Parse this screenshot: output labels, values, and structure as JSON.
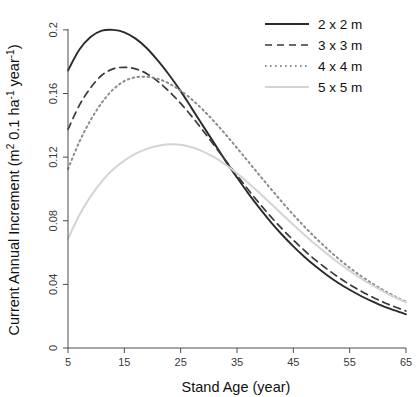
{
  "chart_data": {
    "type": "line",
    "title": "",
    "xlabel": "Stand Age (year)",
    "ylabel": "Current Annual Increment (m2 0.1 ha-1 year-1)",
    "ylabel_parts": {
      "main": "Current Annual Increment (m",
      "sup1": "2",
      "mid": " 0.1 ha",
      "sup2": "-1",
      "mid2": " year",
      "sup3": "-1",
      "close": ")"
    },
    "xlim": [
      5,
      65
    ],
    "ylim": [
      0,
      0.21
    ],
    "xticks": [
      5,
      15,
      25,
      35,
      45,
      55,
      65
    ],
    "xtick_labels": [
      "5",
      "15",
      "25",
      "35",
      "45",
      "55",
      "65"
    ],
    "yticks": [
      0,
      0.04,
      0.08,
      0.12,
      0.16,
      0.2
    ],
    "ytick_labels": [
      "0",
      "0.04",
      "0.08",
      "0.12",
      "0.16",
      "0.2"
    ],
    "grid": false,
    "legend_position": "top-right",
    "x": [
      5,
      7,
      9,
      11,
      13,
      15,
      17,
      19,
      21,
      23,
      25,
      27,
      29,
      31,
      33,
      35,
      37,
      39,
      41,
      43,
      45,
      47,
      49,
      51,
      53,
      55,
      57,
      59,
      61,
      63,
      65
    ],
    "series": [
      {
        "name": "2 x 2 m",
        "style": "solid",
        "color": "#2b2b2b",
        "width": 1.9,
        "peak_age": 13,
        "peak_value": 0.2,
        "values": [
          0.1745,
          0.1875,
          0.1955,
          0.1995,
          0.2,
          0.1985,
          0.1945,
          0.1885,
          0.1805,
          0.1715,
          0.1615,
          0.1505,
          0.1395,
          0.1285,
          0.1175,
          0.1072,
          0.0972,
          0.0879,
          0.0792,
          0.0712,
          0.0639,
          0.0572,
          0.0512,
          0.0458,
          0.0409,
          0.0366,
          0.0327,
          0.0293,
          0.0262,
          0.0236,
          0.0212
        ]
      },
      {
        "name": "3 x 3 m",
        "style": "dashed",
        "color": "#3a3a3a",
        "width": 1.7,
        "peak_age": 15,
        "peak_value": 0.1765,
        "values": [
          0.1375,
          0.1525,
          0.1635,
          0.1715,
          0.1755,
          0.1765,
          0.1755,
          0.1725,
          0.1675,
          0.1612,
          0.1538,
          0.1455,
          0.1365,
          0.1272,
          0.1178,
          0.1085,
          0.0995,
          0.0908,
          0.0826,
          0.0749,
          0.0678,
          0.0612,
          0.0551,
          0.0496,
          0.0445,
          0.0399,
          0.0358,
          0.0321,
          0.0288,
          0.0259,
          0.0233
        ]
      },
      {
        "name": "4 x 4 m",
        "style": "dotted",
        "color": "#8c8c8c",
        "width": 2.0,
        "peak_age": 19,
        "peak_value": 0.1705,
        "values": [
          0.1125,
          0.1295,
          0.1432,
          0.1542,
          0.1625,
          0.1678,
          0.1702,
          0.1705,
          0.1692,
          0.1662,
          0.1618,
          0.1562,
          0.1496,
          0.1422,
          0.1342,
          0.1258,
          0.1172,
          0.1086,
          0.1001,
          0.0918,
          0.0838,
          0.0762,
          0.0691,
          0.0624,
          0.0562,
          0.0505,
          0.0453,
          0.0406,
          0.0363,
          0.0325,
          0.0291
        ]
      },
      {
        "name": "5 x 5 m",
        "style": "solid",
        "color": "#d4d4d4",
        "width": 2.0,
        "peak_age": 22,
        "peak_value": 0.1282,
        "values": [
          0.0688,
          0.0835,
          0.0952,
          0.1048,
          0.1122,
          0.1178,
          0.1222,
          0.1252,
          0.1272,
          0.1281,
          0.1278,
          0.1262,
          0.1235,
          0.1198,
          0.1152,
          0.1098,
          0.1038,
          0.0975,
          0.0908,
          0.0841,
          0.0775,
          0.0711,
          0.0649,
          0.0591,
          0.0536,
          0.0485,
          0.0438,
          0.0395,
          0.0355,
          0.0319,
          0.0287
        ]
      }
    ]
  },
  "legend": {
    "items": [
      {
        "label": "2 x 2 m"
      },
      {
        "label": "3 x 3 m"
      },
      {
        "label": "4 x 4 m"
      },
      {
        "label": "5 x 5 m"
      }
    ]
  }
}
